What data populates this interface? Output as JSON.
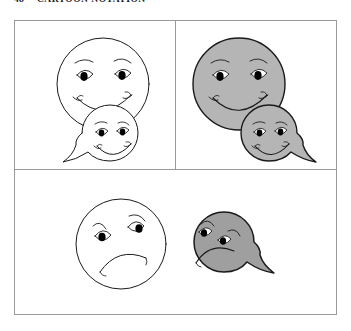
{
  "running_head": {
    "folio": "48",
    "title": "CARTOON NOTATION"
  },
  "figure": {
    "panels": [
      {
        "id": "top-left",
        "name": "panel-top-left",
        "fill_style": "white",
        "expression": "happy",
        "faces": [
          {
            "shape": "circle",
            "expression": "happy",
            "fill": "#ffffff",
            "size": "large"
          },
          {
            "shape": "teardrop",
            "expression": "happy",
            "fill": "#ffffff",
            "size": "small",
            "tail_direction": "left"
          }
        ]
      },
      {
        "id": "top-right",
        "name": "panel-top-right",
        "fill_style": "shaded",
        "expression": "happy",
        "faces": [
          {
            "shape": "circle",
            "expression": "happy",
            "fill": "#b5b5b5",
            "size": "large"
          },
          {
            "shape": "teardrop",
            "expression": "happy",
            "fill": "#b5b5b5",
            "size": "small",
            "tail_direction": "right"
          }
        ]
      },
      {
        "id": "bottom",
        "name": "panel-bottom",
        "fill_style": "mixed",
        "expression": "sad",
        "faces": [
          {
            "shape": "circle",
            "expression": "sad",
            "fill": "#ffffff",
            "size": "large"
          },
          {
            "shape": "teardrop",
            "expression": "sad",
            "fill": "#9f9f9f",
            "size": "small",
            "tail_direction": "right"
          }
        ]
      }
    ]
  },
  "colors": {
    "ink": "#1a1a1a",
    "frame": "#9a9a9a",
    "shade_light": "#b5b5b5",
    "shade_dark": "#9f9f9f",
    "paper": "#ffffff",
    "pupil": "#000000"
  }
}
